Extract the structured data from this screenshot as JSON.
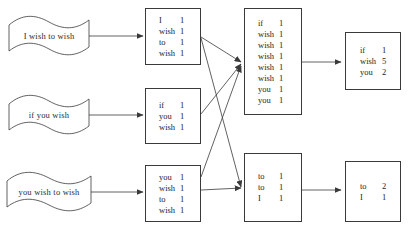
{
  "diagram": {
    "type": "flow-diagram",
    "stroke_color": "#3a3a3a",
    "text_color": "#1e1e1e",
    "background_color": "#ffffff"
  },
  "inputs": [
    {
      "id": "doc1",
      "label": "I wish to wish"
    },
    {
      "id": "doc2",
      "label": "if you wish"
    },
    {
      "id": "doc3",
      "label": "you wish to wish"
    }
  ],
  "map_boxes": [
    {
      "id": "map1",
      "rows": [
        {
          "key": "I",
          "value": "1"
        },
        {
          "key": "wish",
          "value": "1"
        },
        {
          "key": "to",
          "value": "1"
        },
        {
          "key": "wish",
          "value": "1"
        }
      ]
    },
    {
      "id": "map2",
      "rows": [
        {
          "key": "if",
          "value": "1"
        },
        {
          "key": "you",
          "value": "1"
        },
        {
          "key": "wish",
          "value": "1"
        }
      ]
    },
    {
      "id": "map3",
      "rows": [
        {
          "key": "you",
          "value": "1"
        },
        {
          "key": "wish",
          "value": "1"
        },
        {
          "key": "to",
          "value": "1"
        },
        {
          "key": "wish",
          "value": "1"
        }
      ]
    }
  ],
  "shuffle_boxes": [
    {
      "id": "shuffle1",
      "rows": [
        {
          "key": "if",
          "value": "1"
        },
        {
          "key": "wish",
          "value": "1"
        },
        {
          "key": "wish",
          "value": "1"
        },
        {
          "key": "wish",
          "value": "1"
        },
        {
          "key": "wish",
          "value": "1"
        },
        {
          "key": "wish",
          "value": "1"
        },
        {
          "key": "you",
          "value": "1"
        },
        {
          "key": "you",
          "value": "1"
        }
      ]
    },
    {
      "id": "shuffle2",
      "rows": [
        {
          "key": "to",
          "value": "1"
        },
        {
          "key": "to",
          "value": "1"
        },
        {
          "key": "I",
          "value": "1"
        }
      ]
    }
  ],
  "reduce_boxes": [
    {
      "id": "reduce1",
      "rows": [
        {
          "key": "if",
          "value": "1"
        },
        {
          "key": "wish",
          "value": "5"
        },
        {
          "key": "you",
          "value": "2"
        }
      ]
    },
    {
      "id": "reduce2",
      "rows": [
        {
          "key": "to",
          "value": "2"
        },
        {
          "key": "I",
          "value": "1"
        }
      ]
    }
  ]
}
